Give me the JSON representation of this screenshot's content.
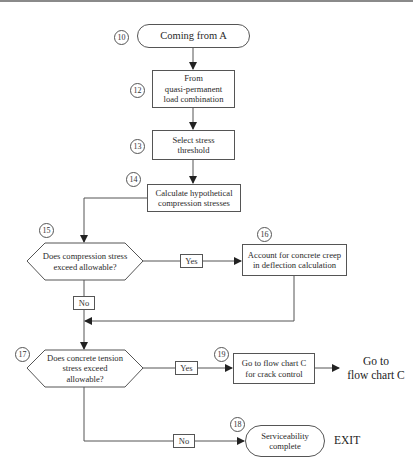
{
  "diagram": {
    "type": "flowchart",
    "nodes": {
      "n10": {
        "number": "10",
        "shape": "terminator",
        "label": "Coming from A"
      },
      "n12": {
        "number": "12",
        "shape": "process",
        "label_lines": [
          "From",
          "quasi-permanent",
          "load combination"
        ]
      },
      "n13": {
        "number": "13",
        "shape": "process",
        "label_lines": [
          "Select stress",
          "threshold"
        ]
      },
      "n14": {
        "number": "14",
        "shape": "process",
        "label_lines": [
          "Calculate hypothetical",
          "compression stresses"
        ]
      },
      "n15": {
        "number": "15",
        "shape": "decision",
        "label_lines": [
          "Does compression stress",
          "exceed allowable?"
        ]
      },
      "n16": {
        "number": "16",
        "shape": "process",
        "label_lines": [
          "Account for concrete creep",
          "in deflection calculation"
        ]
      },
      "n17": {
        "number": "17",
        "shape": "decision",
        "label_lines": [
          "Does concrete tension",
          "stress exceed",
          "allowable?"
        ]
      },
      "n19": {
        "number": "19",
        "shape": "process",
        "label_lines": [
          "Go to flow chart C",
          "for crack control"
        ]
      },
      "n18": {
        "number": "18",
        "shape": "terminator",
        "label_lines": [
          "Serviceability",
          "complete"
        ]
      }
    },
    "edge_labels": {
      "yes_15": "Yes",
      "no_15": "No",
      "yes_17": "Yes",
      "no_17": "No"
    },
    "free_text": {
      "goto_c_lines": [
        "Go to",
        "flow chart C"
      ],
      "exit": "EXIT"
    },
    "edges": [
      {
        "from": "10",
        "to": "12"
      },
      {
        "from": "12",
        "to": "13"
      },
      {
        "from": "13",
        "to": "14"
      },
      {
        "from": "14",
        "to": "15"
      },
      {
        "from": "15",
        "to": "16",
        "label": "Yes"
      },
      {
        "from": "15",
        "to": "17",
        "label": "No"
      },
      {
        "from": "16",
        "to": "17"
      },
      {
        "from": "17",
        "to": "19",
        "label": "Yes"
      },
      {
        "from": "19",
        "to": "Go to flow chart C"
      },
      {
        "from": "17",
        "to": "18",
        "label": "No"
      }
    ]
  }
}
